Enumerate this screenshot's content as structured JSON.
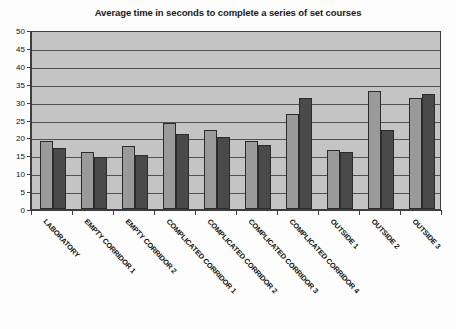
{
  "chart_data": {
    "type": "bar",
    "title": "Average time in seconds to complete a series of set courses",
    "xlabel": "",
    "ylabel": "",
    "ylim": [
      0,
      50
    ],
    "ytick_step": 5,
    "yticks": [
      0,
      5,
      10,
      15,
      20,
      25,
      30,
      35,
      40,
      45,
      50
    ],
    "grid": true,
    "legend": null,
    "categories": [
      "LABORATORY",
      "EMPTY CORRIDOR 1",
      "EMPTY CORRIDOR 2",
      "COMPLICATED CORRIDOR 1",
      "COMPLICATED CORRIDOR 2",
      "COMPLICATED CORRIDOR 3",
      "COMPLICATED CORRIDOR 4",
      "OUTSIDE 1",
      "OUTSIDE 2",
      "OUTSIDE 3"
    ],
    "series": [
      {
        "name": "series-1",
        "color": "#9a9a9a",
        "values": [
          19,
          16,
          17.5,
          24,
          22,
          19,
          26.5,
          16.5,
          33,
          31
        ]
      },
      {
        "name": "series-2",
        "color": "#4a4a4a",
        "values": [
          17,
          14.5,
          15,
          21,
          20,
          18,
          31,
          16,
          22,
          32
        ]
      }
    ],
    "plot_background": "#c4c4c4",
    "axis_color": "#3d3d3d"
  }
}
